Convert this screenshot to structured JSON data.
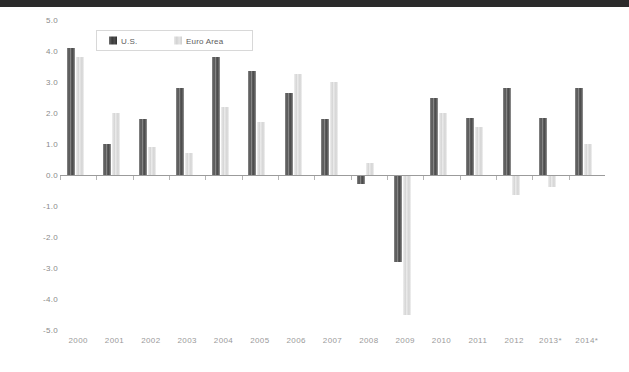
{
  "theme": {
    "background": "#ffffff",
    "top_band_color": "#2b2b2b",
    "axis_color": "#9b9b9b",
    "tick_color": "#b5b5b5",
    "ylabel_color": "#8a8a8a",
    "xlabel_color": "#9a9a9a",
    "legend_border": "#d8d8d8",
    "series_colors": [
      "#4f4f4f",
      "#dddddd"
    ]
  },
  "legend": {
    "position": "top-left-inside",
    "entries": [
      {
        "label": "U.S.",
        "color": "#4f4f4f",
        "swatch": "us-swatch-icon"
      },
      {
        "label": "Euro Area",
        "color": "#dddddd",
        "swatch": "euro-swatch-icon"
      }
    ]
  },
  "chart_data": {
    "type": "bar",
    "title": "",
    "subtitle": "",
    "xlabel": "",
    "ylabel": "",
    "ylim": [
      -5.0,
      5.0
    ],
    "yticks": [
      5.0,
      4.0,
      3.0,
      2.0,
      1.0,
      0.0,
      -1.0,
      -2.0,
      -3.0,
      -4.0,
      -5.0
    ],
    "ytick_labels": [
      "5.0",
      "4.0",
      "3.0",
      "2.0",
      "1.0",
      "0.0",
      "-1.0",
      "-2.0",
      "-3.0",
      "-4.0",
      "-5.0"
    ],
    "grid": false,
    "legend_position": "upper left",
    "categories": [
      "2000",
      "2001",
      "2002",
      "2003",
      "2004",
      "2005",
      "2006",
      "2007",
      "2008",
      "2009",
      "2010",
      "2011",
      "2012",
      "2013*",
      "2014*"
    ],
    "series": [
      {
        "name": "U.S.",
        "color": "#4f4f4f",
        "values": [
          4.1,
          1.0,
          1.8,
          2.8,
          3.8,
          3.35,
          2.65,
          1.8,
          -0.3,
          -2.8,
          2.5,
          1.85,
          2.8,
          1.85,
          2.8
        ]
      },
      {
        "name": "Euro Area",
        "color": "#dddddd",
        "values": [
          3.8,
          2.0,
          0.9,
          0.7,
          2.2,
          1.7,
          3.25,
          3.0,
          0.4,
          -4.5,
          2.0,
          1.55,
          -0.65,
          -0.4,
          1.0
        ]
      }
    ],
    "annotations": [
      "* denotes projected values for 2013 and 2014"
    ]
  }
}
